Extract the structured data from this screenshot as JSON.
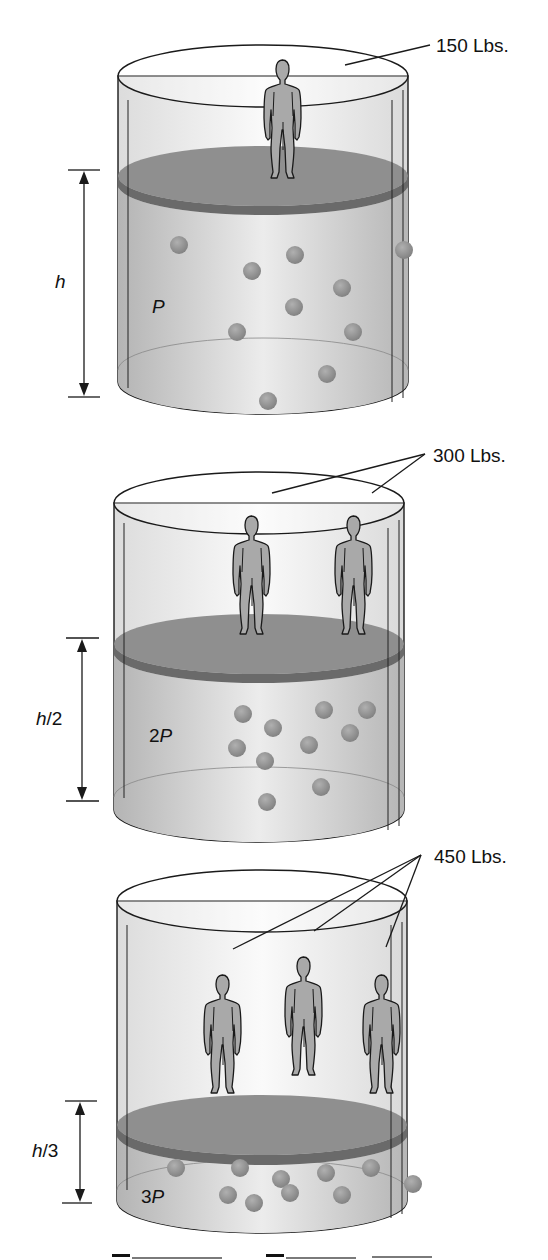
{
  "figure": {
    "panels": [
      {
        "id": "panel-1",
        "weight_label": "150 Lbs.",
        "height_label": "h",
        "height_label_parts": [
          "h",
          ""
        ],
        "pressure_label": "P",
        "pressure_parts": [
          "",
          "P"
        ],
        "people_count": 1,
        "gas_particles": 11
      },
      {
        "id": "panel-2",
        "weight_label": "300 Lbs.",
        "height_label": "h/2",
        "height_label_parts": [
          "h",
          "/2"
        ],
        "pressure_label": "2P",
        "pressure_parts": [
          "2",
          "P"
        ],
        "people_count": 2,
        "gas_particles": 11
      },
      {
        "id": "panel-3",
        "weight_label": "450 Lbs.",
        "height_label": "h/3",
        "height_label_parts": [
          "h",
          "/3"
        ],
        "pressure_label": "3P",
        "pressure_parts": [
          "3",
          "P"
        ],
        "people_count": 3,
        "gas_particles": 11
      }
    ],
    "colors": {
      "cylinder_fill": "#d9d9d9",
      "cylinder_highlight": "#f7f7f7",
      "piston_top": "#8f8f8f",
      "piston_edge": "#6e6e6e",
      "particle": "#8a8a8a",
      "person": "#a9a9a9",
      "outline": "#1a1a1a"
    }
  }
}
